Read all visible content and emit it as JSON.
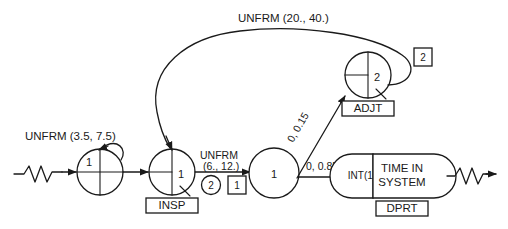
{
  "diagram": {
    "type": "queueing-network-simulation-diagram",
    "background_color": "#ffffff",
    "line_color": "#1a1a1a",
    "labels": {
      "arrival_distribution": "UNFRM (3.5, 7.5)",
      "inspection_distribution": "UNFRM (6., 12.)",
      "adjust_distribution": "UNFRM (20., 40.)",
      "branch_adjust": "0, 0.15",
      "branch_depart": "0, 0.85"
    },
    "nodes": {
      "arrival": {
        "count": "1",
        "name": ""
      },
      "inspect": {
        "count": "1",
        "name": "INSP"
      },
      "decision": {
        "count": "1",
        "name": ""
      },
      "adjust": {
        "count": "2",
        "name": "ADJT"
      },
      "collect": {
        "stat": "INT(1)",
        "title_line1": "TIME IN",
        "title_line2": "SYSTEM",
        "name": "DPRT"
      }
    },
    "activity_markers": {
      "inspect_servers": "2",
      "inspect_activity": "1",
      "adjust_activity": "2"
    }
  }
}
